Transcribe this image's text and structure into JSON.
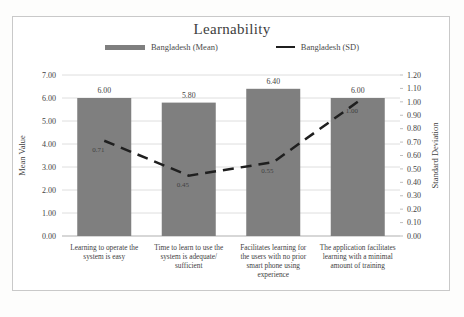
{
  "chart_data": {
    "type": "bar",
    "title": "Learnability",
    "categories": [
      "Learning to operate the system is easy",
      "Time to learn to use the system is adequate/ sufficient",
      "Facilitates learning for the users with no prior smart phone using experience",
      "The application facilitates learning with a minimal amount of training"
    ],
    "series": [
      {
        "name": "Bangladesh (Mean)",
        "type": "bar",
        "axis": "left",
        "values": [
          6.0,
          5.8,
          6.4,
          6.0
        ],
        "labels": [
          "6.00",
          "5.80",
          "6.40",
          "6.00"
        ],
        "color": "#7f7f7f"
      },
      {
        "name": "Bangladesh (SD)",
        "type": "line",
        "axis": "right",
        "dashed": true,
        "values": [
          0.71,
          0.45,
          0.55,
          1.0
        ],
        "labels": [
          "0.71",
          "0.45",
          "0.55",
          "1.00"
        ],
        "color": "#1f1f1f"
      }
    ],
    "left_axis": {
      "label": "Mean Value",
      "min": 0,
      "max": 7,
      "step": 1
    },
    "right_axis": {
      "label": "Standard Deviation",
      "min": 0,
      "max": 1.2,
      "step": 0.1
    },
    "grid": true,
    "legend_position": "top",
    "colors": {
      "gridline": "#dedede",
      "axis_line": "#bfbfbf",
      "text": "#424242"
    }
  }
}
